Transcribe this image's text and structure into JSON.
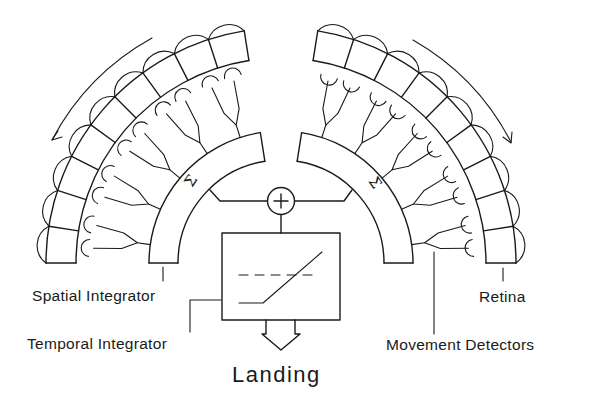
{
  "figure": {
    "title": "Landing",
    "labels": {
      "spatial_integrator": "Spatial Integrator",
      "temporal_integrator": "Temporal Integrator",
      "retina": "Retina",
      "movement_detectors": "Movement Detectors",
      "output": "Landing"
    },
    "symbols": {
      "summation": "Σ",
      "adder": "+"
    },
    "nodes": [
      {
        "id": "retina-left",
        "type": "arc-array",
        "cells": 9
      },
      {
        "id": "retina-right",
        "type": "arc-array",
        "cells": 9
      },
      {
        "id": "movement-detectors-left",
        "type": "branching-detectors"
      },
      {
        "id": "movement-detectors-right",
        "type": "branching-detectors"
      },
      {
        "id": "spatial-integrator-left",
        "type": "arc-band",
        "symbol": "Σ"
      },
      {
        "id": "spatial-integrator-right",
        "type": "arc-band",
        "symbol": "Σ"
      },
      {
        "id": "adder",
        "type": "circle",
        "symbol": "+"
      },
      {
        "id": "temporal-integrator",
        "type": "box",
        "content": "threshold ramp with dashed threshold line"
      },
      {
        "id": "landing-output",
        "type": "arrow",
        "label": "Landing"
      }
    ],
    "edges": [
      [
        "retina-left",
        "movement-detectors-left"
      ],
      [
        "movement-detectors-left",
        "spatial-integrator-left"
      ],
      [
        "retina-right",
        "movement-detectors-right"
      ],
      [
        "movement-detectors-right",
        "spatial-integrator-right"
      ],
      [
        "spatial-integrator-left",
        "adder"
      ],
      [
        "spatial-integrator-right",
        "adder"
      ],
      [
        "adder",
        "temporal-integrator"
      ],
      [
        "temporal-integrator",
        "landing-output"
      ]
    ],
    "motion_arrows": [
      "counter-clockwise over left retina",
      "clockwise over right retina"
    ],
    "colors": {
      "ink": "#1a1a1a",
      "background": "#ffffff"
    }
  }
}
